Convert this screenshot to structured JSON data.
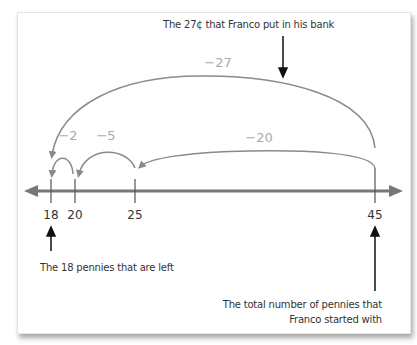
{
  "diagram": {
    "type": "number_line_subtraction",
    "colors": {
      "arc": "#8a8a8a",
      "axis": "#777777",
      "label": "#999999",
      "pointer": "#111111",
      "text": "#333333"
    },
    "ticks": [
      {
        "value": 18,
        "label": "18",
        "x": 51
      },
      {
        "value": 20,
        "label": "20",
        "x": 75
      },
      {
        "value": 25,
        "label": "25",
        "x": 135
      },
      {
        "value": 45,
        "label": "45",
        "x": 375
      }
    ],
    "jumps": [
      {
        "from": 45,
        "to": 18,
        "label": "−27"
      },
      {
        "from": 45,
        "to": 25,
        "label": "−20"
      },
      {
        "from": 25,
        "to": 20,
        "label": "−5"
      },
      {
        "from": 20,
        "to": 18,
        "label": "−2"
      }
    ],
    "annotations": {
      "top": "The 27¢ that Franco put in his bank",
      "left": "The 18 pennies that are left",
      "right_line1": "The total number of pennies that",
      "right_line2": "Franco started with"
    }
  }
}
